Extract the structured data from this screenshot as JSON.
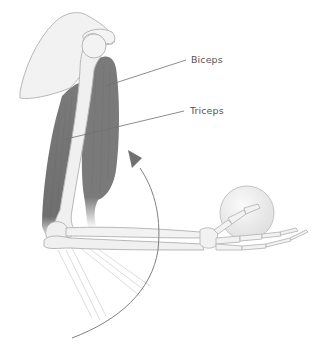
{
  "diagram": {
    "labels": {
      "biceps": "Biceps",
      "triceps": "Triceps"
    },
    "colors": {
      "background": "#ffffff",
      "bone_fill": "#f0f0f0",
      "bone_outline": "#b8b8b8",
      "muscle": "#7a7a7a",
      "muscle_dark": "#6b6b6b",
      "ghost_forearm": "#dcdcdc",
      "arrow": "#808080",
      "leader_line": "#707070",
      "label_text": "#555555",
      "ball_fill": "#eeeeee"
    },
    "annotations": [
      {
        "id": "biceps",
        "text": "Biceps",
        "points_to": "biceps-muscle"
      },
      {
        "id": "triceps",
        "text": "Triceps",
        "points_to": "triceps-muscle"
      }
    ],
    "motion": {
      "type": "flexion-arc",
      "direction": "upward (elbow flexing forearm toward shoulder)"
    }
  }
}
